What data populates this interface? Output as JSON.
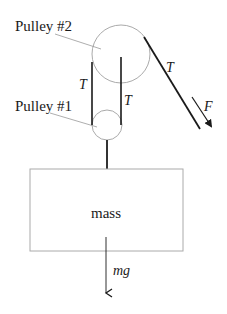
{
  "diagram": {
    "labels": {
      "pulley2": "Pulley #2",
      "pulley1": "Pulley #1",
      "tension_left": "T",
      "tension_right": "T",
      "tension_diag": "T",
      "force": "F",
      "mass": "mass",
      "weight": "mg"
    },
    "colors": {
      "rope": "#1a1a1a",
      "outline": "#aaaaaa",
      "text": "#1a1a1a"
    }
  }
}
